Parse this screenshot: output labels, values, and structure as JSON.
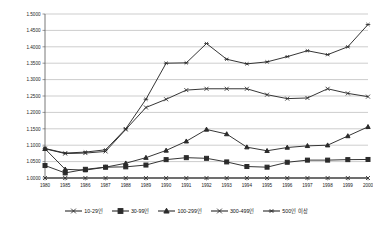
{
  "chart_data": {
    "type": "line",
    "title": "",
    "xlabel": "",
    "ylabel": "",
    "grid": true,
    "legend_position": "bottom",
    "ylim": [
      1.0,
      1.5
    ],
    "ytick_step": 0.05,
    "ytick_labels": [
      "1.0000",
      "1.0500",
      "1.1000",
      "1.1500",
      "1.2000",
      "1.2500",
      "1.3000",
      "1.3500",
      "1.4000",
      "1.4500",
      "1.5000"
    ],
    "categories": [
      "1980",
      "1985",
      "1986",
      "1987",
      "1988",
      "1989",
      "1990",
      "1991",
      "1992",
      "1993",
      "1994",
      "1995",
      "1996",
      "1997",
      "1998",
      "1999",
      "2000"
    ],
    "series": [
      {
        "name": "10-29인",
        "marker": "x",
        "values": [
          1.0,
          1.0,
          1.0,
          1.0,
          1.0,
          1.0,
          1.0,
          1.0,
          1.0,
          1.0,
          1.0,
          1.0,
          1.0,
          1.0,
          1.0,
          1.0,
          1.0
        ]
      },
      {
        "name": "30-99인",
        "marker": "square",
        "values": [
          1.038,
          1.0155,
          1.0265,
          1.033,
          1.034,
          1.0395,
          1.056,
          1.062,
          1.06,
          1.049,
          1.035,
          1.033,
          1.048,
          1.0545,
          1.0545,
          1.056,
          1.0565
        ]
      },
      {
        "name": "100-299인",
        "marker": "triangle",
        "values": [
          1.089,
          1.0265,
          1.024,
          1.033,
          1.045,
          1.062,
          1.084,
          1.112,
          1.148,
          1.134,
          1.094,
          1.083,
          1.093,
          1.098,
          1.1,
          1.128,
          1.156
        ]
      },
      {
        "name": "300-499인",
        "marker": "x",
        "values": [
          1.089,
          1.0745,
          1.076,
          1.081,
          1.148,
          1.215,
          1.24,
          1.268,
          1.272,
          1.272,
          1.272,
          1.254,
          1.242,
          1.244,
          1.272,
          1.258,
          1.248
        ]
      },
      {
        "name": "500인 이상",
        "marker": "asterisk",
        "values": [
          1.09,
          1.076,
          1.079,
          1.086,
          1.15,
          1.24,
          1.35,
          1.351,
          1.41,
          1.362,
          1.348,
          1.354,
          1.37,
          1.388,
          1.376,
          1.4,
          1.468
        ]
      }
    ]
  },
  "series_extra": {
    "300-499-late": [
      1.248,
      1.258,
      1.294,
      1.272,
      1.256,
      1.296,
      1.31
    ],
    "500-late": [
      1.388,
      1.376,
      1.4,
      1.468,
      1.47
    ]
  },
  "legend": {
    "items": [
      {
        "label": "10-29인",
        "marker": "x"
      },
      {
        "label": "30-99인",
        "marker": "square"
      },
      {
        "label": "100-299인",
        "marker": "triangle"
      },
      {
        "label": "300-499인",
        "marker": "x"
      },
      {
        "label": "500인 이상",
        "marker": "asterisk"
      }
    ]
  },
  "colors": {
    "line": "#2b2b2b",
    "grid": "#9a9a9a",
    "axis": "#555555",
    "background": "#ffffff",
    "text": "#1a1a1a"
  }
}
